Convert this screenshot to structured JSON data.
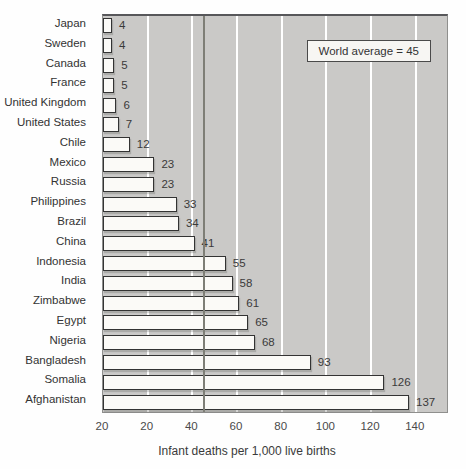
{
  "chart_data": {
    "type": "bar",
    "orientation": "horizontal",
    "xlabel": "Infant deaths per 1,000 live births",
    "categories": [
      "Japan",
      "Sweden",
      "Canada",
      "France",
      "United Kingdom",
      "United States",
      "Chile",
      "Mexico",
      "Russia",
      "Philippines",
      "Brazil",
      "China",
      "Indonesia",
      "India",
      "Zimbabwe",
      "Egypt",
      "Nigeria",
      "Bangladesh",
      "Somalia",
      "Afghanistan"
    ],
    "values": [
      4,
      4,
      5,
      5,
      6,
      7,
      12,
      23,
      23,
      33,
      34,
      41,
      55,
      58,
      61,
      65,
      68,
      93,
      126,
      137
    ],
    "value_labels": [
      "4",
      "4",
      "5",
      "5",
      "6",
      "7",
      "12",
      "23",
      "23",
      "33",
      "34",
      "41",
      "55",
      "58",
      "61",
      "65",
      "68",
      "93",
      "126",
      "137"
    ],
    "x_tick_values": [
      0,
      20,
      40,
      60,
      80,
      100,
      120,
      140
    ],
    "x_tick_labels": [
      "20",
      "20",
      "40",
      "60",
      "80",
      "100",
      "120",
      "140"
    ],
    "gridline_values": [
      20,
      40,
      60,
      80,
      100,
      120,
      140
    ],
    "xlim": [
      0,
      154
    ],
    "grid": true,
    "legend": "none",
    "annotation": {
      "text": "World average = 45",
      "value": 45
    },
    "colors": {
      "plot_bg": "#cac9c7",
      "bar_fill": "#fbfaf7",
      "bar_border": "#333333",
      "gridline": "#ffffff",
      "average_line": "#7e7e76",
      "text": "#3a3a3a"
    }
  }
}
